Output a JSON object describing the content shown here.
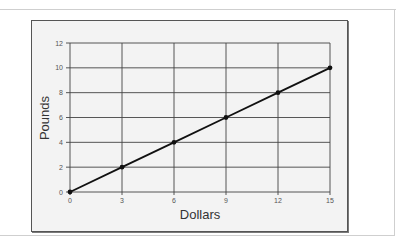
{
  "chart_data": {
    "type": "line",
    "title": "",
    "xlabel": "Dollars",
    "ylabel": "Pounds",
    "x": [
      0,
      3,
      6,
      9,
      12,
      15
    ],
    "series": [
      {
        "name": "Pounds vs Dollars",
        "values": [
          0,
          2,
          4,
          6,
          8,
          10
        ],
        "color": "#111111",
        "markers": true
      }
    ],
    "xlim": [
      0,
      15
    ],
    "ylim": [
      0,
      12
    ],
    "xticks": [
      "0",
      "3",
      "6",
      "9",
      "12",
      "15"
    ],
    "yticks": [
      "0",
      "2",
      "4",
      "6",
      "8",
      "10",
      "12"
    ],
    "grid": true,
    "legend": null
  },
  "colors": {
    "plot_background": "#f3f3f3",
    "grid": "#444444",
    "line": "#111111",
    "frame": "#555555"
  }
}
